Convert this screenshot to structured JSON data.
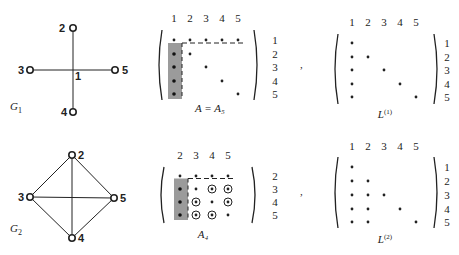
{
  "figure": {
    "graphs": [
      {
        "id": "G1",
        "label": "G",
        "subscript": "1",
        "nodes": [
          {
            "id": "1",
            "x": 73,
            "y": 70,
            "label": "1",
            "hub": true
          },
          {
            "id": "2",
            "x": 73,
            "y": 28,
            "label": "2"
          },
          {
            "id": "3",
            "x": 30,
            "y": 70,
            "label": "3"
          },
          {
            "id": "4",
            "x": 73,
            "y": 112,
            "label": "4"
          },
          {
            "id": "5",
            "x": 115,
            "y": 70,
            "label": "5"
          }
        ],
        "edges": [
          [
            "1",
            "2"
          ],
          [
            "1",
            "3"
          ],
          [
            "1",
            "4"
          ],
          [
            "1",
            "5"
          ]
        ]
      },
      {
        "id": "G2",
        "label": "G",
        "subscript": "2",
        "nodes": [
          {
            "id": "2",
            "x": 72,
            "y": 155,
            "label": "2"
          },
          {
            "id": "3",
            "x": 30,
            "y": 197,
            "label": "3"
          },
          {
            "id": "4",
            "x": 72,
            "y": 238,
            "label": "4"
          },
          {
            "id": "5",
            "x": 114,
            "y": 198,
            "label": "5"
          }
        ],
        "edges": [
          [
            "2",
            "3"
          ],
          [
            "2",
            "4"
          ],
          [
            "2",
            "5"
          ],
          [
            "3",
            "4"
          ],
          [
            "3",
            "5"
          ],
          [
            "4",
            "5"
          ]
        ]
      }
    ],
    "matrices": [
      {
        "id": "A5",
        "caption": "A = A₅",
        "col_labels": [
          "1",
          "2",
          "3",
          "4",
          "5"
        ],
        "row_labels": [
          "1",
          "2",
          "3",
          "4",
          "5"
        ],
        "entries": [
          [
            "*",
            "*",
            "*",
            "*",
            "*"
          ],
          [
            "*",
            "*",
            "",
            "",
            ""
          ],
          [
            "*",
            "",
            "*",
            "",
            ""
          ],
          [
            "*",
            "",
            "",
            "*",
            ""
          ],
          [
            "*",
            "",
            "",
            "",
            "*"
          ]
        ],
        "shaded_first_column": true,
        "dashed_first_row": true
      },
      {
        "id": "L1",
        "caption": "L",
        "caption_sup": "(1)",
        "col_labels": [
          "1",
          "2",
          "3",
          "4",
          "5"
        ],
        "row_labels": [
          "1",
          "2",
          "3",
          "4",
          "5"
        ],
        "entries": [
          [
            "*",
            "",
            "",
            "",
            ""
          ],
          [
            "*",
            "*",
            "",
            "",
            ""
          ],
          [
            "*",
            "",
            "*",
            "",
            ""
          ],
          [
            "*",
            "",
            "",
            "*",
            ""
          ],
          [
            "*",
            "",
            "",
            "",
            "*"
          ]
        ]
      },
      {
        "id": "A4",
        "caption": "A₄",
        "col_labels": [
          "2",
          "3",
          "4",
          "5"
        ],
        "row_labels": [
          "2",
          "3",
          "4",
          "5"
        ],
        "entries": [
          [
            "*",
            "*",
            "*",
            "*"
          ],
          [
            "*",
            "*",
            "⊛",
            "⊛"
          ],
          [
            "*",
            "⊛",
            "*",
            "⊛"
          ],
          [
            "*",
            "⊛",
            "⊛",
            "*"
          ]
        ],
        "fill_in_symbol": "⊛",
        "shaded_first_column": true,
        "dashed_first_row": true
      },
      {
        "id": "L2",
        "caption": "L",
        "caption_sup": "(2)",
        "col_labels": [
          "1",
          "2",
          "3",
          "4",
          "5"
        ],
        "row_labels": [
          "1",
          "2",
          "3",
          "4",
          "5"
        ],
        "entries": [
          [
            "*",
            "",
            "",
            "",
            ""
          ],
          [
            "*",
            "*",
            "",
            "",
            ""
          ],
          [
            "*",
            "*",
            "*",
            "",
            ""
          ],
          [
            "*",
            "*",
            "",
            "*",
            ""
          ],
          [
            "*",
            "*",
            "",
            "",
            "*"
          ]
        ]
      }
    ],
    "separators": [
      ",",
      ","
    ],
    "colors": {
      "ink": "#222222",
      "shade": "#7a7a7a",
      "background": "#ffffff"
    }
  }
}
